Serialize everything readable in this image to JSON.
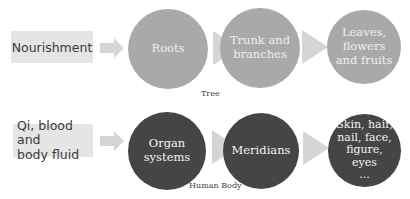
{
  "colors": {
    "box_fill": "#e5e5e5",
    "arrow_fill": "#d5d5d5",
    "tree_circle_fill": "#a9a9a9",
    "body_circle_fill": "#454545"
  },
  "rows": [
    {
      "caption": "Tree",
      "source_box": "Nourishment",
      "nodes": [
        "Roots",
        "Trunk and\nbranches",
        "Leaves,\nflowers\nand fruits"
      ]
    },
    {
      "caption": "Human Body",
      "source_box": "Qi, blood and\nbody fluid",
      "nodes": [
        "Organ\nsystems",
        "Meridians",
        "Skin, hair,\nnail, face,\nfigure, eyes\n..."
      ]
    }
  ]
}
